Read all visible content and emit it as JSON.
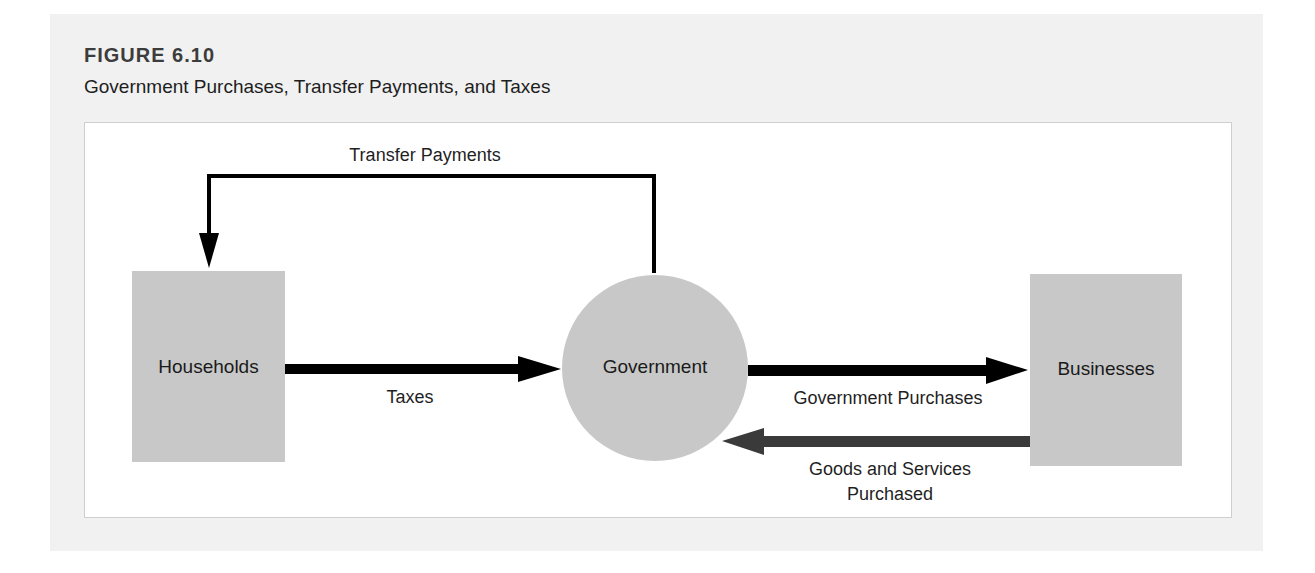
{
  "figure": {
    "label": "FIGURE 6.10",
    "title": "Government Purchases, Transfer Payments, and Taxes"
  },
  "nodes": {
    "households": {
      "label": "Households",
      "shape": "rectangle",
      "fill": "#c8c8c8"
    },
    "government": {
      "label": "Government",
      "shape": "circle",
      "fill": "#c8c8c8"
    },
    "businesses": {
      "label": "Businesses",
      "shape": "rectangle",
      "fill": "#c8c8c8"
    }
  },
  "flows": {
    "transfer_payments": {
      "label": "Transfer Payments",
      "from": "Government",
      "to": "Households",
      "color": "#000000"
    },
    "taxes": {
      "label": "Taxes",
      "from": "Households",
      "to": "Government",
      "color": "#000000"
    },
    "government_purchases": {
      "label": "Government Purchases",
      "from": "Government",
      "to": "Businesses",
      "color": "#000000"
    },
    "goods_services": {
      "label_line1": "Goods and Services",
      "label_line2": "Purchased",
      "from": "Businesses",
      "to": "Government",
      "color": "#3a3a3a"
    }
  },
  "colors": {
    "panel_bg": "#f1f1f1",
    "frame_bg": "#ffffff",
    "node_fill": "#c8c8c8"
  }
}
